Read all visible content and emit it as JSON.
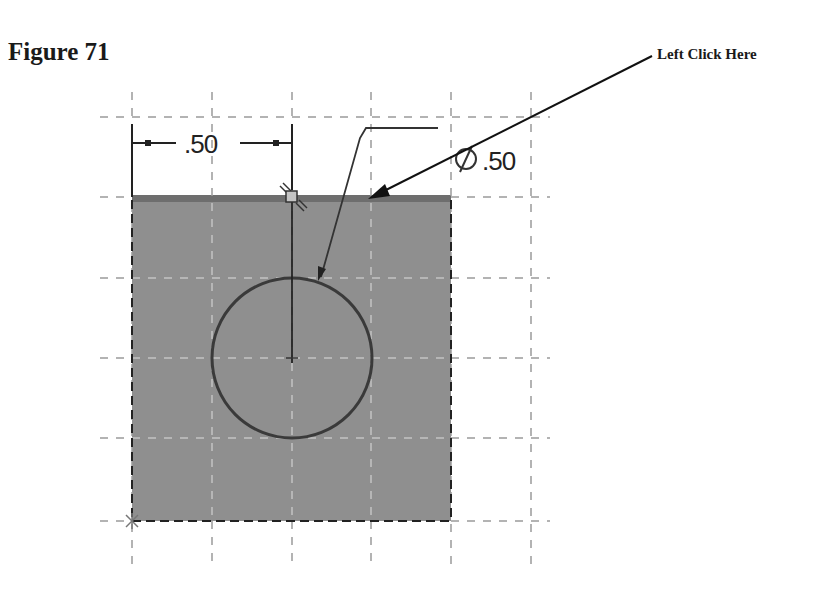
{
  "figure": {
    "title": "Figure 71",
    "callout_label": "Left Click Here"
  },
  "sketch": {
    "colors": {
      "face_fill": "#8f8f8f",
      "face_top_edge": "#6e6e6e",
      "grid_line": "#9a9a9a",
      "grid_on_face": "#c8c8c8",
      "geometry_line": "#2a2a2a",
      "circle_line": "#3a3a3a",
      "point_marker_fill": "#bdbdbd"
    },
    "linear_dimension": {
      "value": ".50",
      "from_x": 132,
      "to_x": 292
    },
    "diameter_dimension": {
      "symbol": "⌀",
      "value": ".50"
    },
    "rectangle": {
      "x": 132,
      "y": 197,
      "width": 319,
      "height": 324
    },
    "circle": {
      "cx": 292,
      "cy": 358,
      "r": 80
    },
    "grid": {
      "vertical_x": [
        132,
        212,
        292,
        371,
        451,
        531
      ],
      "horizontal_y": [
        117,
        197,
        278,
        358,
        438,
        521
      ]
    }
  }
}
